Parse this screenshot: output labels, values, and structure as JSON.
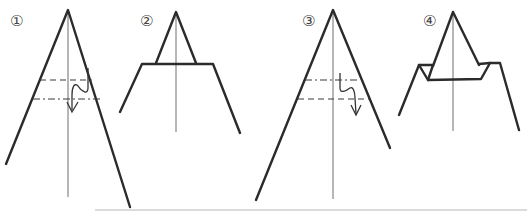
{
  "diagram": {
    "type": "origami-folding-steps",
    "colors": {
      "line": "#2b2b2b",
      "center": "#6e6e6e",
      "background": "#ffffff"
    },
    "steps": [
      {
        "label": "①",
        "fold_lines": [
          {
            "kind": "valley",
            "style": "dashed"
          },
          {
            "kind": "mountain",
            "style": "dash-dot"
          }
        ],
        "arrow": "fold-down"
      },
      {
        "label": "②"
      },
      {
        "label": "③",
        "fold_lines": [
          {
            "kind": "mountain",
            "style": "dash-dot"
          },
          {
            "kind": "valley",
            "style": "dashed"
          }
        ],
        "arrow": "fold-down"
      },
      {
        "label": "④"
      }
    ]
  }
}
